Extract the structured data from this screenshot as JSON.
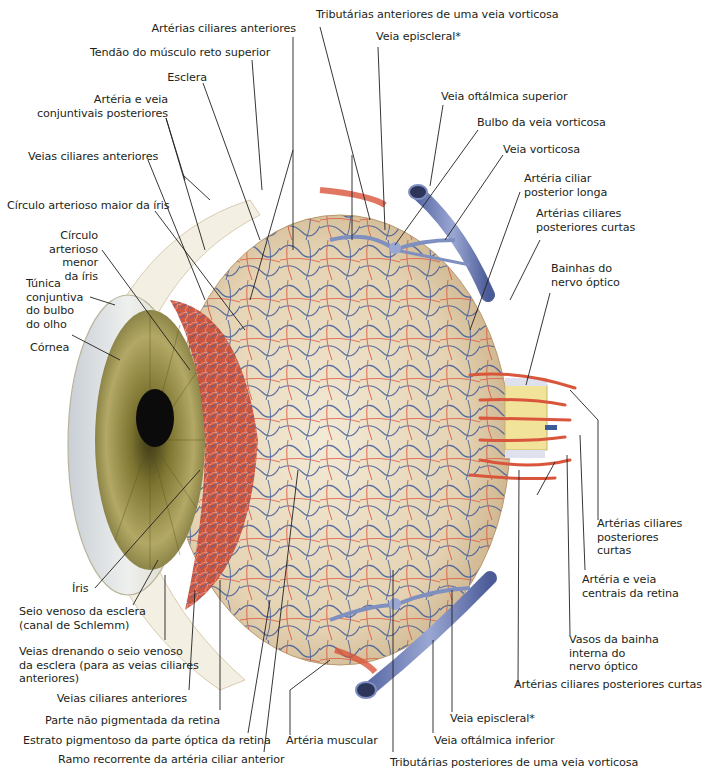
{
  "figure": {
    "colors": {
      "artery": "#d9553b",
      "vein": "#3e5a99",
      "vein_large": "#7f8fc0",
      "sclera": "#eadfc8",
      "iris": "#a49a4a",
      "pupil": "#0b0b0b",
      "nerve": "#f2e39a",
      "leader_line": "#231f20"
    }
  },
  "labels": {
    "top": [
      {
        "id": "arterias-ciliares-anteriores-top",
        "text": "Artérias ciliares anteriores"
      },
      {
        "id": "tendao-reto-superior",
        "text": "Tendão do músculo reto superior"
      },
      {
        "id": "esclera",
        "text": "Esclera"
      },
      {
        "id": "arteria-veia-conjuntivais",
        "text": "Artéria e veia\nconjuntivais posteriores"
      },
      {
        "id": "tributarias-anteriores",
        "text": "Tributárias anteriores de uma veia vorticosa"
      },
      {
        "id": "veia-episcleral-top",
        "text": "Veia episcleral*"
      }
    ],
    "left": [
      {
        "id": "veias-ciliares-anteriores-top",
        "text": "Veias ciliares anteriores"
      },
      {
        "id": "circulo-maior",
        "text": "Círculo arterioso maior da íris"
      },
      {
        "id": "circulo-menor",
        "text": "Círculo\narterioso menor\nda íris"
      },
      {
        "id": "tunica-conjuntiva",
        "text": "Túnica\nconjuntiva\ndo bulbo\ndo olho"
      },
      {
        "id": "cornea",
        "text": "Córnea"
      },
      {
        "id": "iris",
        "text": "Íris"
      },
      {
        "id": "seio-venoso",
        "text": "Seio venoso da esclera\n(canal de Schlemm)"
      },
      {
        "id": "veias-drenando",
        "text": "Veias drenando o seio venoso\nda esclera (para as veias ciliares\nanteriores)"
      }
    ],
    "right": [
      {
        "id": "veia-oftalmica-superior",
        "text": "Veia oftálmica superior"
      },
      {
        "id": "bulbo-veia-vorticosa",
        "text": "Bulbo da veia vorticosa"
      },
      {
        "id": "veia-vorticosa",
        "text": "Veia vorticosa"
      },
      {
        "id": "arteria-ciliar-posterior-longa",
        "text": "Artéria ciliar\nposterior longa"
      },
      {
        "id": "arterias-ciliares-posteriores-curtas-top",
        "text": "Artérias ciliares\nposteriores curtas"
      },
      {
        "id": "bainhas-nervo-optico",
        "text": "Bainhas do\nnervo óptico"
      },
      {
        "id": "arterias-ciliares-posteriores-curtas-mid",
        "text": "Artérias ciliares\nposteriores\ncurtas"
      },
      {
        "id": "arteria-veia-centrais",
        "text": "Artéria e veia\ncentrais da retina"
      },
      {
        "id": "vasos-bainha-interna",
        "text": "Vasos da bainha\ninterna do\nnervo óptico"
      },
      {
        "id": "arterias-ciliares-posteriores-curtas-bottom",
        "text": "Artérias ciliares posteriores curtas"
      }
    ],
    "bottom": [
      {
        "id": "veias-ciliares-anteriores-bottom",
        "text": "Veias ciliares anteriores"
      },
      {
        "id": "parte-nao-pigmentada",
        "text": "Parte não pigmentada da retina"
      },
      {
        "id": "estrato-pigmentoso",
        "text": "Estrato pigmentoso da parte óptica da retina"
      },
      {
        "id": "ramo-recorrente",
        "text": "Ramo recorrente da artéria ciliar anterior"
      },
      {
        "id": "arteria-muscular",
        "text": "Artéria muscular"
      },
      {
        "id": "veia-episcleral-bottom",
        "text": "Veia episcleral*"
      },
      {
        "id": "veia-oftalmica-inferior",
        "text": "Veia oftálmica inferior"
      },
      {
        "id": "tributarias-posteriores",
        "text": "Tributárias posteriores de uma veia vorticosa"
      }
    ]
  }
}
